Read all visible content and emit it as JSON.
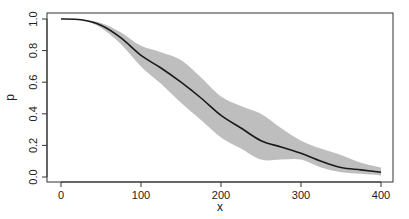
{
  "chart_data": {
    "type": "line",
    "title": "",
    "xlabel": "x",
    "ylabel": "p",
    "xlim": [
      0,
      400
    ],
    "ylim": [
      0,
      1
    ],
    "grid": false,
    "legend": null,
    "x_ticks": [
      0,
      100,
      200,
      300,
      400
    ],
    "x_tick_labels": [
      "0",
      "100",
      "200",
      "300",
      "400"
    ],
    "y_ticks": [
      0.0,
      0.2,
      0.4,
      0.6,
      0.8,
      1.0
    ],
    "y_tick_labels": [
      "0.0",
      "0.2",
      "0.4",
      "0.6",
      "0.8",
      "1.0"
    ],
    "series": [
      {
        "name": "p",
        "kind": "line",
        "color": "#1a1a1a",
        "x": [
          0,
          25,
          50,
          75,
          100,
          125,
          150,
          175,
          200,
          225,
          250,
          275,
          300,
          325,
          350,
          375,
          400
        ],
        "values": [
          1.0,
          0.995,
          0.96,
          0.88,
          0.77,
          0.69,
          0.6,
          0.5,
          0.39,
          0.31,
          0.23,
          0.19,
          0.15,
          0.1,
          0.06,
          0.045,
          0.03
        ]
      },
      {
        "name": "confidence band",
        "kind": "band",
        "color": "#bebebe",
        "x": [
          0,
          25,
          50,
          75,
          100,
          125,
          150,
          175,
          200,
          225,
          250,
          275,
          300,
          325,
          350,
          375,
          400
        ],
        "upper": [
          1.0,
          0.997,
          0.975,
          0.915,
          0.83,
          0.79,
          0.74,
          0.63,
          0.51,
          0.45,
          0.4,
          0.31,
          0.23,
          0.18,
          0.14,
          0.09,
          0.06
        ],
        "lower": [
          1.0,
          0.993,
          0.945,
          0.84,
          0.7,
          0.59,
          0.47,
          0.36,
          0.25,
          0.18,
          0.11,
          0.11,
          0.11,
          0.06,
          0.03,
          0.02,
          0.01
        ]
      }
    ]
  },
  "layout": {
    "plot_left": 47,
    "plot_top": 13,
    "plot_right": 393,
    "plot_bottom": 182,
    "x0_px": 61,
    "x1_px": 381,
    "y0_px": 177,
    "y1_px": 19
  }
}
